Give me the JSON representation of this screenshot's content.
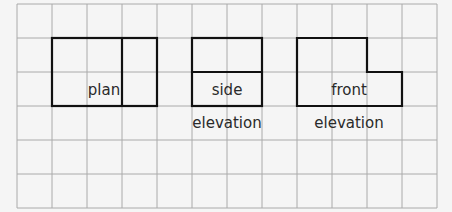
{
  "diagram": {
    "title": "",
    "grid": {
      "columns": 12,
      "rows": 6,
      "line_color": "#aaaaaa",
      "background": "#f5f5f5"
    },
    "views": [
      {
        "id": "plan",
        "label_lines": [
          "plan"
        ]
      },
      {
        "id": "side-elevation",
        "label_lines": [
          "side",
          "elevation"
        ]
      },
      {
        "id": "front-elevation",
        "label_lines": [
          "front",
          "elevation"
        ]
      }
    ],
    "outline_color": "#111111"
  }
}
